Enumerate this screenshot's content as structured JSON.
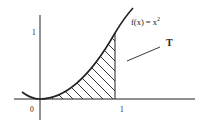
{
  "diagram": {
    "function_label": "f(x) = x",
    "function_exponent": "2",
    "region_label": "T",
    "y_tick_label": "1",
    "origin_label": "0",
    "x_tick_label": "1",
    "stroke_color": "#222222",
    "background_color": "#ffffff"
  }
}
